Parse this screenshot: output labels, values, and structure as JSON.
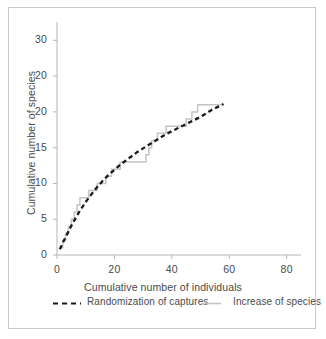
{
  "chart_data": {
    "type": "line",
    "title": "",
    "xlabel": "Cumulative number of individuals",
    "ylabel": "Cumulative number of species",
    "xlim": [
      0,
      85
    ],
    "ylim": [
      0,
      32
    ],
    "grid": false,
    "legend_position": "bottom",
    "xticks": [
      0,
      20,
      40,
      60,
      80
    ],
    "xtick_labels": [
      "0",
      "20",
      "40",
      "60",
      "80"
    ],
    "yticks": [
      0,
      5,
      10,
      15,
      20,
      25,
      30
    ],
    "ytick_labels": [
      "0",
      "5",
      "10",
      "15",
      "20",
      "20",
      "30"
    ],
    "series": [
      {
        "name": "Randomization of captures",
        "style": "dashed",
        "color": "#1a1a1a",
        "x": [
          1,
          2,
          3,
          4,
          5,
          6,
          7,
          8,
          9,
          10,
          12,
          14,
          16,
          18,
          20,
          22,
          24,
          26,
          28,
          30,
          32,
          34,
          36,
          38,
          40,
          42,
          44,
          46,
          48,
          50,
          52,
          54,
          56,
          58
        ],
        "y": [
          0.8,
          1.7,
          2.5,
          3.3,
          4.1,
          4.8,
          5.5,
          6.2,
          6.8,
          7.4,
          8.5,
          9.5,
          10.4,
          11.2,
          11.9,
          12.6,
          13.2,
          13.8,
          14.4,
          14.9,
          15.4,
          15.9,
          16.4,
          16.9,
          17.3,
          17.7,
          18.1,
          18.5,
          18.9,
          19.3,
          19.8,
          20.3,
          20.7,
          21.1
        ]
      },
      {
        "name": "Increase of species",
        "style": "step",
        "color": "#c4c4c4",
        "x": [
          1,
          2,
          3,
          4,
          5,
          6,
          7,
          8,
          9,
          10,
          11,
          13,
          14,
          16,
          17,
          18,
          19,
          21,
          22,
          23,
          26,
          31,
          32,
          33,
          34,
          35,
          36,
          38,
          40,
          43,
          45,
          46,
          47,
          49,
          52,
          55,
          58
        ],
        "y": [
          1,
          2,
          3,
          4,
          5,
          6,
          7,
          8,
          8,
          8,
          9,
          9,
          10,
          10,
          11,
          11,
          12,
          12,
          13,
          13,
          13,
          14,
          15,
          16,
          16,
          17,
          17,
          18,
          18,
          18,
          19,
          19,
          20,
          21,
          21,
          21,
          21
        ]
      }
    ]
  },
  "legend": {
    "entries": [
      {
        "label": "Randomization of captures",
        "swatch": "dashed-line-swatch"
      },
      {
        "label": "Increase of species",
        "swatch": "solid-line-swatch"
      }
    ]
  },
  "colors": {
    "randomization_line": "#1a1a1a",
    "increase_line": "#c4c4c4",
    "axis": "#b5b5b5",
    "text": "#4a4a4a",
    "frame": "#c9c9c9",
    "background": "#ffffff"
  }
}
